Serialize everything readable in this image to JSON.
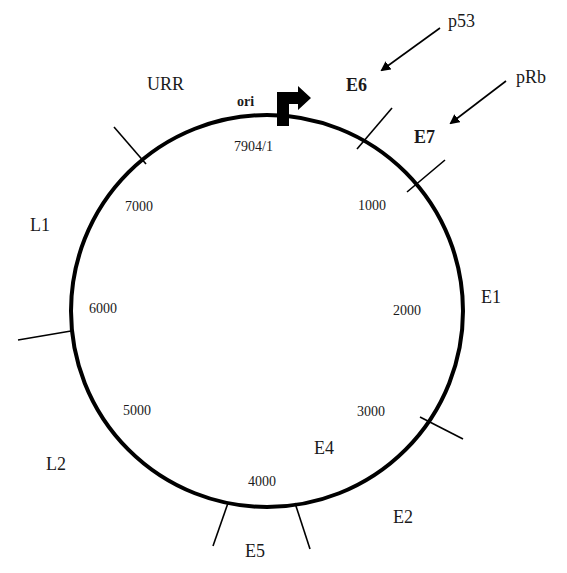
{
  "diagram": {
    "genome_length_label": "7904/1",
    "origin": {
      "label": "ori",
      "icon": "promoter-arrow-icon"
    },
    "regulatory_region": "URR",
    "position_markers": [
      "1000",
      "2000",
      "3000",
      "4000",
      "5000",
      "6000",
      "7000"
    ],
    "genes": {
      "E6": "E6",
      "E7": "E7",
      "E1": "E1",
      "E2": "E2",
      "E4": "E4",
      "E5": "E5",
      "L2": "L2",
      "L1": "L1"
    },
    "interactors": [
      {
        "label": "p53",
        "target": "E6"
      },
      {
        "label": "pRb",
        "target": "E7"
      }
    ],
    "colors": {
      "line": "#000000",
      "text": "#1a1a1a",
      "background": "#ffffff"
    }
  }
}
